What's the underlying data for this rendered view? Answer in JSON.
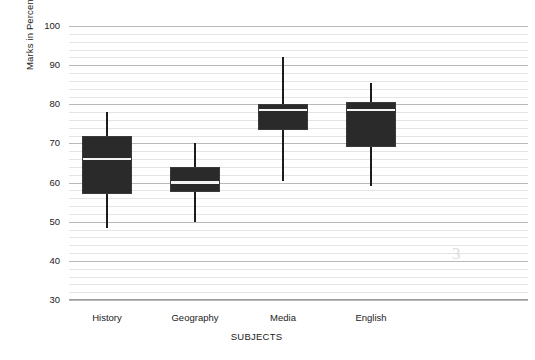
{
  "chart_data": {
    "type": "box",
    "title": "",
    "xlabel": "SUBJECTS",
    "ylabel": "Marks in Percentages %",
    "ylim": [
      30,
      100
    ],
    "ytick_labels": [
      "100",
      "90",
      "80",
      "70",
      "60",
      "50",
      "40",
      "30"
    ],
    "ytick_values": [
      100,
      90,
      80,
      70,
      60,
      50,
      40,
      30
    ],
    "minor_gridlines": true,
    "minor_tick_step": 2,
    "grid": true,
    "legend": "none",
    "categories": [
      "History",
      "Geography",
      "Media",
      "English"
    ],
    "boxes": [
      {
        "category": "History",
        "whisker_low": 48.5,
        "q1": 57,
        "median": 66,
        "q3": 72,
        "whisker_high": 78
      },
      {
        "category": "Geography",
        "whisker_low": 50,
        "q1": 57.5,
        "median": 60,
        "q3": 64,
        "whisker_high": 70
      },
      {
        "category": "Media",
        "whisker_low": 60.5,
        "q1": 73.5,
        "median": 78.5,
        "q3": 80,
        "whisker_high": 92
      },
      {
        "category": "English",
        "whisker_low": 59,
        "q1": 69,
        "median": 78.5,
        "q3": 80.5,
        "whisker_high": 85.5
      }
    ],
    "colors": {
      "box_fill": "#2a2a2a",
      "box_edge": "#3a3a3a",
      "median": "#f4f4f4",
      "whisker": "#1c1c1c",
      "grid_major": "#b9b9b9",
      "grid_minor": "#e4e4e4",
      "background": "#ffffff",
      "text": "#222222"
    }
  },
  "axis": {
    "y_title": "Marks in Percentages %",
    "x_title": "SUBJECTS"
  },
  "artifact": {
    "mark": "3"
  }
}
